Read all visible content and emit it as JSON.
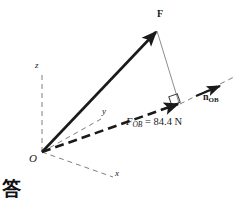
{
  "figure": {
    "background_color": "#ffffff",
    "stroke_color": "#1a1a1a",
    "width": 241,
    "height": 204
  },
  "origin": {
    "label": "O",
    "x": 42,
    "y": 152
  },
  "axes": [
    {
      "name": "z-axis",
      "label": "z",
      "style": "dashed",
      "from": [
        42,
        152
      ],
      "to": [
        42,
        74
      ],
      "label_x": 36,
      "label_y": 66
    },
    {
      "name": "y-axis",
      "label": "y",
      "style": "dashed",
      "from": [
        42,
        152
      ],
      "to": [
        101,
        119
      ],
      "label_x": 103,
      "label_y": 112
    },
    {
      "name": "x-axis",
      "label": "x",
      "style": "dashed",
      "from": [
        42,
        152
      ],
      "to": [
        113,
        177
      ],
      "label_x": 116,
      "label_y": 174
    }
  ],
  "vectors": [
    {
      "name": "force-vector",
      "label": "F",
      "style": "solid-thick",
      "from": [
        42,
        152
      ],
      "to": [
        157,
        31
      ],
      "label_x": 159,
      "label_y": 14
    },
    {
      "name": "projection-vector",
      "label_symbol": "F",
      "label_subscript": "OB",
      "label_value": "= 84.4 N",
      "label_full": "F_OB = 84.4 N",
      "style": "dashed-thick",
      "from": [
        42,
        152
      ],
      "to": [
        180,
        104
      ],
      "label_x": 129,
      "label_y": 123
    },
    {
      "name": "unit-vector",
      "label_symbol": "n",
      "label_subscript": "OB",
      "label_full": "n_OB",
      "style": "solid-thick-short",
      "from": [
        196,
        96
      ],
      "to": [
        221,
        86
      ],
      "label_x": 205,
      "label_y": 97
    }
  ],
  "construction_lines": [
    {
      "name": "ob-extension-line",
      "style": "dashed-thin",
      "from": [
        180,
        104
      ],
      "to": [
        236,
        76
      ]
    },
    {
      "name": "perpendicular-drop-line",
      "style": "solid-thin",
      "from": [
        157,
        31
      ],
      "to": [
        179,
        103
      ]
    }
  ],
  "markers": [
    {
      "name": "right-angle-marker",
      "x": 172,
      "y": 96,
      "size": 9
    }
  ],
  "annotations": {
    "answer_marker": "答"
  }
}
